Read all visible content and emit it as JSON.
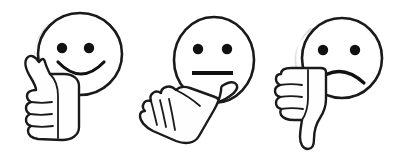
{
  "image": {
    "title": "Feedback rating emoticons with hand gestures",
    "background_color": "#ffffff",
    "ink_color": "#1a1a1a",
    "shade_color": "#d9d9d9",
    "width": 403,
    "height": 163,
    "style": "hand-drawn line art, black outline on white"
  },
  "items": [
    {
      "id": "positive",
      "label": "Positive rating",
      "face_icon_name": "smiley-face-happy-icon",
      "hand_icon_name": "thumbs-up-icon",
      "expression": "smile",
      "gesture": "thumb pointing up",
      "face": {
        "cx": 80,
        "cy": 54,
        "rx": 42,
        "ry": 41
      },
      "eyes": [
        {
          "cx": 62,
          "cy": 48,
          "r": 5.2
        },
        {
          "cx": 89,
          "cy": 48,
          "r": 5.2
        }
      ],
      "mouth": {
        "type": "arc-down",
        "path": "M 58 62 Q 81 86 104 62"
      }
    },
    {
      "id": "neutral",
      "label": "Neutral rating",
      "face_icon_name": "smiley-face-neutral-icon",
      "hand_icon_name": "thumb-sideways-icon",
      "expression": "straight line",
      "gesture": "thumb pointing sideways",
      "face": {
        "cx": 214,
        "cy": 60,
        "rx": 40,
        "ry": 43
      },
      "eyes": [
        {
          "cx": 198,
          "cy": 49,
          "r": 5.2
        },
        {
          "cx": 227,
          "cy": 49,
          "r": 5.2
        }
      ],
      "mouth": {
        "type": "line",
        "path": "M 192 73 L 233 73"
      }
    },
    {
      "id": "negative",
      "label": "Negative rating",
      "face_icon_name": "smiley-face-sad-icon",
      "hand_icon_name": "thumbs-down-icon",
      "expression": "frown",
      "gesture": "thumb pointing down",
      "face": {
        "cx": 342,
        "cy": 58,
        "rx": 40,
        "ry": 40
      },
      "eyes": [
        {
          "cx": 323,
          "cy": 50,
          "r": 5.2
        },
        {
          "cx": 355,
          "cy": 50,
          "r": 5.2
        }
      ],
      "mouth": {
        "type": "arc-up",
        "path": "M 314 83 Q 339 60 364 83"
      }
    }
  ]
}
